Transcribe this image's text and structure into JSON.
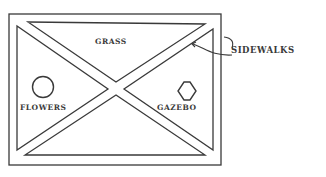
{
  "diagram": {
    "labels": {
      "grass": "GRASS",
      "sidewalks": "SIDEWALKS",
      "flowers": "FLOWERS",
      "gazebo": "GAZEBO"
    },
    "colors": {
      "stroke": "#3a3a3a",
      "background": "#ffffff"
    },
    "features": [
      {
        "name": "flowers",
        "shape": "circle"
      },
      {
        "name": "gazebo",
        "shape": "hexagon"
      }
    ]
  }
}
